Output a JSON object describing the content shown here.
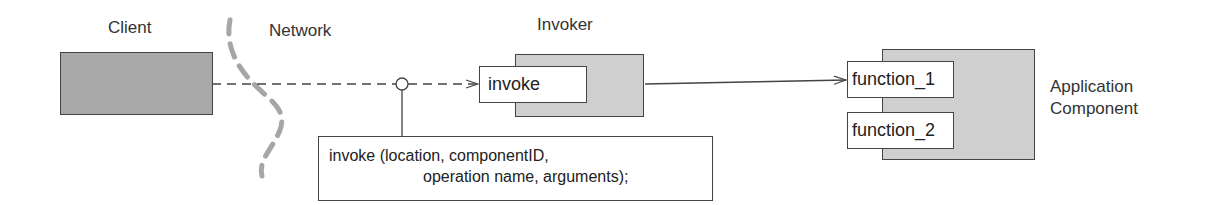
{
  "labels": {
    "client": "Client",
    "network": "Network",
    "invoker": "Invoker",
    "application_line1": "Application",
    "application_line2": "Component"
  },
  "invoker": {
    "operation": "invoke"
  },
  "application": {
    "functions": [
      "function_1",
      "function_2"
    ]
  },
  "note": {
    "line1": "invoke (location, componentID,",
    "line2": "operation name, arguments);"
  },
  "colors": {
    "client_fill": "#a8a8a8",
    "component_fill": "#cfcfcf",
    "network_boundary": "#a6a6a6",
    "stroke": "#444444"
  }
}
